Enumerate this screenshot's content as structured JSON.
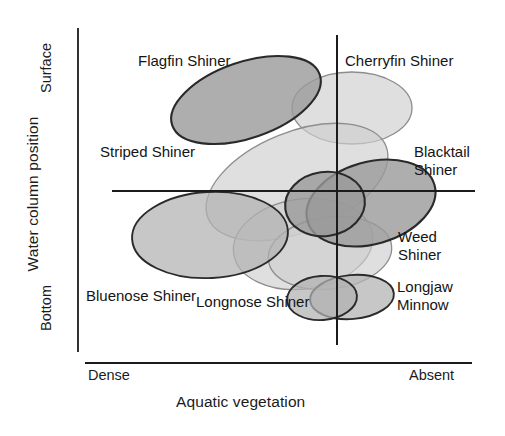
{
  "figure": {
    "type": "niche-diagram",
    "background": "#ffffff"
  },
  "axes": {
    "y_title": "Water column position",
    "y_ticks": [
      "Surface",
      "Bottom"
    ],
    "x_title": "Aquatic vegetation",
    "x_ticks": [
      "Dense",
      "Absent"
    ]
  },
  "chart_data": {
    "type": "scatter",
    "title": "",
    "xlabel": "Aquatic vegetation",
    "ylabel": "Water column position",
    "xlim": [
      "Dense",
      "Absent"
    ],
    "ylim": [
      "Bottom",
      "Surface"
    ],
    "grid": false,
    "legend": "none",
    "note": "Eight overlapping ellipses show the habitat niche envelope of each shiner species across aquatic vegetation density (x) and water column position (y).",
    "series": [
      {
        "name": "Flagfin Shiner",
        "vegetation": "dense-to-intermediate",
        "water_column": "surface",
        "shade": "dark",
        "ellipse": {
          "cx": 246,
          "cy": 100,
          "rx": 78,
          "ry": 38,
          "rotate": -19
        }
      },
      {
        "name": "Cherryfin Shiner",
        "vegetation": "intermediate-to-absent",
        "water_column": "surface",
        "shade": "light",
        "ellipse": {
          "cx": 352,
          "cy": 108,
          "rx": 60,
          "ry": 36,
          "rotate": 0
        }
      },
      {
        "name": "Striped Shiner",
        "vegetation": "dense-to-absent",
        "water_column": "mid",
        "shade": "light",
        "ellipse": {
          "cx": 297,
          "cy": 182,
          "rx": 96,
          "ry": 50,
          "rotate": -22
        }
      },
      {
        "name": "Blacktail Shiner",
        "vegetation": "absent",
        "water_column": "mid",
        "shade": "dark",
        "ellipse": {
          "cx": 371,
          "cy": 203,
          "rx": 66,
          "ry": 41,
          "rotate": -16
        }
      },
      {
        "name": "Bluenose Shiner",
        "vegetation": "dense",
        "water_column": "bottom-mid",
        "shade": "medium",
        "ellipse": {
          "cx": 210,
          "cy": 235,
          "rx": 78,
          "ry": 43,
          "rotate": -3
        }
      },
      {
        "name": "Longnose Shiner",
        "vegetation": "intermediate",
        "water_column": "bottom",
        "shade": "light",
        "ellipse": {
          "cx": 303,
          "cy": 244,
          "rx": 70,
          "ry": 45,
          "rotate": -8
        }
      },
      {
        "name": "Weed Shiner",
        "vegetation": "intermediate-to-absent",
        "water_column": "bottom",
        "shade": "light",
        "ellipse": {
          "cx": 330,
          "cy": 253,
          "rx": 62,
          "ry": 36,
          "rotate": -7
        }
      },
      {
        "name": "Longjaw Minnow",
        "vegetation": "absent",
        "water_column": "bottom",
        "shade": "medium",
        "ellipse": {
          "cx": 352,
          "cy": 297,
          "rx": 42,
          "ry": 22,
          "rotate": -5
        }
      }
    ],
    "extra_ellipses": [
      {
        "belongs_to": "Longjaw Minnow",
        "cx": 322,
        "cy": 298,
        "rx": 35,
        "ry": 22,
        "rotate": -4
      },
      {
        "belongs_to": "Blacktail Shiner",
        "cx": 325,
        "cy": 204,
        "rx": 40,
        "ry": 32,
        "rotate": -8
      }
    ]
  },
  "labels": [
    {
      "name": "Flagfin Shiner",
      "x": 138,
      "y": 52
    },
    {
      "name": "Cherryfin Shiner",
      "x": 345,
      "y": 52
    },
    {
      "name": "Striped Shiner",
      "x": 100,
      "y": 143
    },
    {
      "name": "Blacktail\nShiner",
      "x": 414,
      "y": 143
    },
    {
      "name": "Weed\nShiner",
      "x": 398,
      "y": 228
    },
    {
      "name": "Longjaw\nMinnow",
      "x": 397,
      "y": 278
    },
    {
      "name": "Bluenose Shiner",
      "x": 86,
      "y": 287
    },
    {
      "name": "Longnose Shiner",
      "x": 196,
      "y": 293
    }
  ],
  "colors": {
    "dark_fill": "#9a9a9a",
    "medium_fill": "#b2b2b2",
    "light_fill": "#cfcfcf",
    "dark_stroke": "#2a2a2a",
    "light_stroke": "#8d8d8d",
    "axis": "#1b1b1b",
    "text": "#141414"
  },
  "geometry": {
    "x_axis": {
      "x1": 112,
      "y1": 191,
      "x2": 475,
      "y2": 191
    },
    "y_axis": {
      "x1": 337,
      "y1": 35,
      "x2": 337,
      "y2": 345
    },
    "y_scale_bar": {
      "x1": 78,
      "y1": 28,
      "x2": 78,
      "y2": 352
    },
    "x_scale_bar": {
      "x1": 85,
      "y1": 363,
      "x2": 472,
      "y2": 363
    }
  }
}
